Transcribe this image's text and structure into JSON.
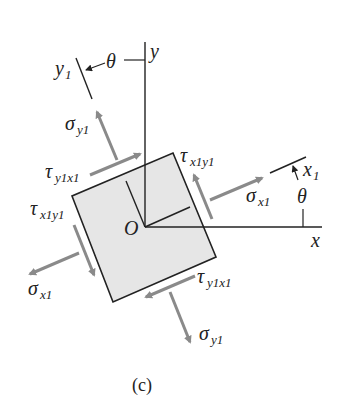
{
  "figure": {
    "caption": "(c)",
    "colors": {
      "axis": "#222222",
      "element_fill": "#e6e6e6",
      "element_stroke": "#222222",
      "stress_arrow": "#8a8a8a"
    },
    "axes": {
      "x_label": "x",
      "y_label": "y",
      "x1_label": "x",
      "x1_sub": "1",
      "y1_label": "y",
      "y1_sub": "1",
      "origin_label": "O",
      "angle_label_top": "θ",
      "angle_label_right": "θ"
    },
    "stresses": {
      "sigma_x1_right": {
        "sym": "σ",
        "sub": "x1"
      },
      "sigma_x1_left": {
        "sym": "σ",
        "sub": "x1"
      },
      "sigma_y1_top": {
        "sym": "σ",
        "sub": "y1"
      },
      "sigma_y1_bottom": {
        "sym": "σ",
        "sub": "y1"
      },
      "tau_x1y1_right": {
        "sym": "τ",
        "sub": "x1y1"
      },
      "tau_x1y1_left": {
        "sym": "τ",
        "sub": "x1y1"
      },
      "tau_y1x1_top": {
        "sym": "τ",
        "sub": "y1x1"
      },
      "tau_y1x1_bottom": {
        "sym": "τ",
        "sub": "y1x1"
      }
    }
  }
}
